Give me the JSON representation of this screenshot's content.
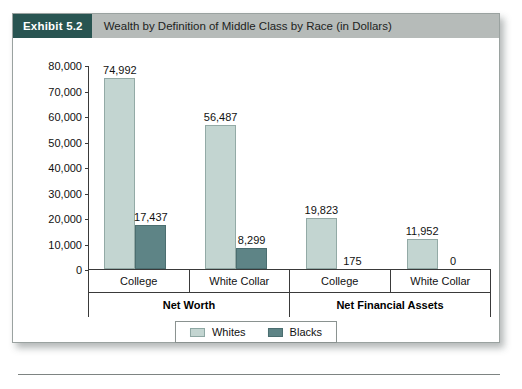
{
  "exhibit": {
    "tag": "Exhibit 5.2",
    "title": "Wealth by Definition of Middle Class by Race (in Dollars)"
  },
  "colors": {
    "whites_bar": "#c3d5d1",
    "blacks_bar": "#5e8486",
    "header_tag_bg": "#285451",
    "header_band_bg": "#b6bbb9",
    "axis": "#3a3a3a"
  },
  "chart_data": {
    "type": "bar",
    "title": "Wealth by Definition of Middle Class by Race (in Dollars)",
    "xlabel": "",
    "ylabel": "",
    "ylim": [
      0,
      80000
    ],
    "ytick_labels": [
      "80,000",
      "70,000",
      "60,000",
      "50,000",
      "40,000",
      "30,000",
      "20,000",
      "10,000",
      "0"
    ],
    "ytick_values": [
      80000,
      70000,
      60000,
      50000,
      40000,
      30000,
      20000,
      10000,
      0
    ],
    "grid": false,
    "legend_position": "bottom-center",
    "group_labels": [
      "Net Worth",
      "Net Financial Assets"
    ],
    "categories": [
      "College",
      "White Collar",
      "College",
      "White Collar"
    ],
    "series": [
      {
        "name": "Whites",
        "color": "#c3d5d1",
        "values": [
          74992,
          56487,
          19823,
          11952
        ],
        "value_labels": [
          "74,992",
          "56,487",
          "19,823",
          "11,952"
        ]
      },
      {
        "name": "Blacks",
        "color": "#5e8486",
        "values": [
          17437,
          8299,
          175,
          0
        ],
        "value_labels": [
          "17,437",
          "8,299",
          "175",
          "0"
        ]
      }
    ],
    "groups": [
      {
        "label": "Net Worth",
        "categories": [
          {
            "label": "College",
            "whites": 74992,
            "blacks": 17437
          },
          {
            "label": "White Collar",
            "whites": 56487,
            "blacks": 8299
          }
        ]
      },
      {
        "label": "Net Financial Assets",
        "categories": [
          {
            "label": "College",
            "whites": 19823,
            "blacks": 175
          },
          {
            "label": "White Collar",
            "whites": 11952,
            "blacks": 0
          }
        ]
      }
    ]
  },
  "legend": {
    "items": [
      {
        "label": "Whites",
        "color": "#c3d5d1"
      },
      {
        "label": "Blacks",
        "color": "#5e8486"
      }
    ]
  }
}
